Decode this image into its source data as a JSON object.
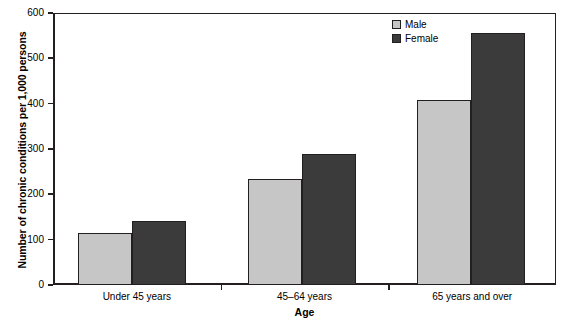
{
  "chart_data": {
    "type": "bar",
    "title": "",
    "xlabel": "Age",
    "ylabel": "Number of chronic conditions per 1,000 persons",
    "categories": [
      "Under 45 years",
      "45–64 years",
      "65 years and over"
    ],
    "series": [
      {
        "name": "Male",
        "values": [
          115,
          234,
          408
        ],
        "color": "#c6c6c6"
      },
      {
        "name": "Female",
        "values": [
          142,
          288,
          555
        ],
        "color": "#3b3b3b"
      }
    ],
    "ylim": [
      0,
      600
    ],
    "yticks": [
      0,
      100,
      200,
      300,
      400,
      500,
      600
    ],
    "ytick_labels": [
      "0",
      "100",
      "200",
      "300",
      "400",
      "500",
      "600"
    ],
    "grid": false,
    "legend_position": "top-right",
    "legend_entries": [
      "Male",
      "Female"
    ]
  },
  "axis": {
    "y_title": "Number of chronic conditions per 1,000 persons",
    "x_title": "Age"
  },
  "legend": {
    "items": [
      {
        "label": "Male"
      },
      {
        "label": "Female"
      }
    ]
  },
  "colors": {
    "male": "#c6c6c6",
    "female": "#3b3b3b",
    "axis": "#231f20",
    "background": "#ffffff"
  }
}
